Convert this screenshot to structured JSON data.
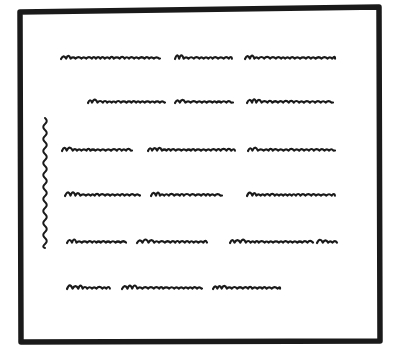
{
  "figure": {
    "description": "Hand-drawn sketch of a document page with squiggly placeholder lines representing text and a wavy vertical margin mark beside a block of lines",
    "ink_color": "#1a1a1a",
    "paper_color": "#ffffff",
    "frame": {
      "x1": 20,
      "y1": 10,
      "x2": 379,
      "y2": 341,
      "stroke_width": 5.5
    },
    "margin_mark": {
      "x": 45,
      "y_start": 118,
      "y_end": 248
    },
    "text_rows": [
      {
        "y": 58,
        "segments": [
          [
            61,
            160
          ],
          [
            175,
            232
          ],
          [
            245,
            335
          ]
        ]
      },
      {
        "y": 102,
        "segments": [
          [
            88,
            165
          ],
          [
            175,
            233
          ],
          [
            247,
            333
          ]
        ]
      },
      {
        "y": 150,
        "segments": [
          [
            62,
            132
          ],
          [
            148,
            235
          ],
          [
            248,
            335
          ]
        ]
      },
      {
        "y": 195,
        "segments": [
          [
            65,
            140
          ],
          [
            151,
            222
          ],
          [
            247,
            335
          ]
        ]
      },
      {
        "y": 242,
        "segments": [
          [
            67,
            126
          ],
          [
            137,
            207
          ],
          [
            230,
            313
          ],
          [
            317,
            337
          ]
        ]
      },
      {
        "y": 288,
        "segments": [
          [
            67,
            110
          ],
          [
            122,
            202
          ],
          [
            213,
            280
          ]
        ]
      }
    ]
  }
}
